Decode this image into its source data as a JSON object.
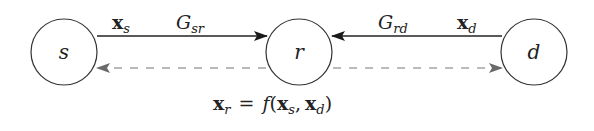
{
  "diagram": {
    "type": "relay-network",
    "nodes": [
      {
        "id": "s",
        "label": "s"
      },
      {
        "id": "r",
        "label": "r"
      },
      {
        "id": "d",
        "label": "d"
      }
    ],
    "edges": [
      {
        "from": "s",
        "to": "r",
        "style": "solid",
        "signal_base": "x",
        "signal_sub": "s",
        "gain_base": "G",
        "gain_sub": "sr"
      },
      {
        "from": "d",
        "to": "r",
        "style": "solid",
        "signal_base": "x",
        "signal_sub": "d",
        "gain_base": "G",
        "gain_sub": "rd"
      },
      {
        "from": "r",
        "to": "s",
        "style": "dashed"
      },
      {
        "from": "r",
        "to": "d",
        "style": "dashed"
      }
    ],
    "equation": {
      "lhs_base": "x",
      "lhs_sub": "r",
      "equals": "=",
      "func": "f",
      "open": "(",
      "arg1_base": "x",
      "arg1_sub": "s",
      "comma": ",",
      "arg2_base": "x",
      "arg2_sub": "d",
      "close": ")"
    },
    "colors": {
      "solid_edge": "#222222",
      "dashed_edge": "#707070",
      "node_stroke": "#333333"
    }
  }
}
